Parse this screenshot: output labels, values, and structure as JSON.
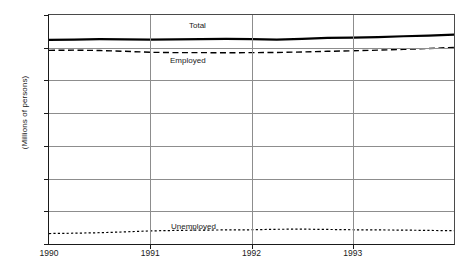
{
  "chart_data": {
    "type": "line",
    "title": "",
    "xlabel": "",
    "ylabel": "(Millions of persons)",
    "xlim": [
      1990,
      1994
    ],
    "ylim": [
      0,
      140
    ],
    "yticks": [
      0,
      20,
      40,
      60,
      80,
      100,
      120,
      140
    ],
    "xticks": [
      1990,
      1991,
      1992,
      1993
    ],
    "xtick_labels": [
      "1990",
      "1991",
      "1992",
      "1993"
    ],
    "grid": "horizontal-and-year-verticals",
    "legend_position": "inline-annotations",
    "series": [
      {
        "name": "Total",
        "label": "Total",
        "style": "solid-thick",
        "color": "#000000",
        "x": [
          1990.0,
          1990.25,
          1990.5,
          1990.75,
          1991.0,
          1991.25,
          1991.5,
          1991.75,
          1992.0,
          1992.25,
          1992.5,
          1992.75,
          1993.0,
          1993.25,
          1993.5,
          1993.75,
          1994.0
        ],
        "values": [
          124.8,
          125.0,
          125.2,
          125.1,
          125.0,
          125.1,
          125.3,
          125.4,
          125.2,
          125.0,
          125.4,
          126.0,
          126.2,
          126.5,
          127.0,
          127.4,
          128.0
        ]
      },
      {
        "name": "Employed",
        "label": "Employed",
        "style": "dashed",
        "color": "#000000",
        "x": [
          1990.0,
          1990.25,
          1990.5,
          1990.75,
          1991.0,
          1991.25,
          1991.5,
          1991.75,
          1992.0,
          1992.25,
          1992.5,
          1992.75,
          1993.0,
          1993.25,
          1993.5,
          1993.75,
          1994.0
        ],
        "values": [
          118.4,
          118.5,
          118.3,
          117.8,
          117.2,
          117.0,
          117.0,
          116.9,
          117.0,
          117.1,
          117.4,
          117.8,
          118.1,
          118.5,
          119.0,
          119.5,
          120.2
        ]
      },
      {
        "name": "Unemployed",
        "label": "Unemployed",
        "style": "dotted",
        "color": "#000000",
        "x": [
          1990.0,
          1990.25,
          1990.5,
          1990.75,
          1991.0,
          1991.25,
          1991.5,
          1991.75,
          1992.0,
          1992.25,
          1992.5,
          1992.75,
          1993.0,
          1993.25,
          1993.5,
          1993.75,
          1994.0
        ],
        "values": [
          6.4,
          6.6,
          6.9,
          7.4,
          8.0,
          8.3,
          8.5,
          8.6,
          8.7,
          9.0,
          9.1,
          8.9,
          8.7,
          8.6,
          8.5,
          8.3,
          8.1
        ]
      }
    ]
  }
}
